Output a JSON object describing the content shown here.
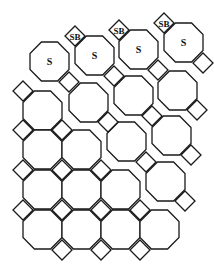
{
  "diagram": {
    "colors": {
      "stroke": "#1a1a1a",
      "fill": "#ffffff",
      "text": "#111111"
    },
    "octagon_size": 39,
    "diamond_half": 10,
    "octagons": [
      {
        "x": 30,
        "y": 42,
        "label": "S",
        "chamfer": []
      },
      {
        "x": 69,
        "y": 83,
        "label": "",
        "chamfer": []
      },
      {
        "x": 107,
        "y": 122,
        "label": "",
        "chamfer": []
      },
      {
        "x": 146,
        "y": 162,
        "label": "",
        "chamfer": []
      },
      {
        "x": 75,
        "y": 36,
        "label": "S",
        "chamfer": []
      },
      {
        "x": 114,
        "y": 76,
        "label": "",
        "chamfer": []
      },
      {
        "x": 152,
        "y": 116,
        "label": "",
        "chamfer": []
      },
      {
        "x": 119,
        "y": 30,
        "label": "S",
        "chamfer": []
      },
      {
        "x": 158,
        "y": 71,
        "label": "",
        "chamfer": []
      },
      {
        "x": 164,
        "y": 23,
        "label": "S",
        "chamfer": []
      },
      {
        "x": 23,
        "y": 91,
        "label": "",
        "chamfer": []
      },
      {
        "x": 23,
        "y": 130,
        "label": "",
        "chamfer": []
      },
      {
        "x": 62,
        "y": 130,
        "label": "",
        "chamfer": []
      },
      {
        "x": 23,
        "y": 170,
        "label": "",
        "chamfer": []
      },
      {
        "x": 62,
        "y": 170,
        "label": "",
        "chamfer": []
      },
      {
        "x": 101,
        "y": 170,
        "label": "",
        "chamfer": []
      },
      {
        "x": 23,
        "y": 210,
        "label": "",
        "chamfer": []
      },
      {
        "x": 62,
        "y": 210,
        "label": "",
        "chamfer": []
      },
      {
        "x": 101,
        "y": 210,
        "label": "",
        "chamfer": []
      },
      {
        "x": 140,
        "y": 210,
        "label": "",
        "chamfer": []
      }
    ],
    "diamonds": [
      {
        "x": 69,
        "y": 82,
        "label": ""
      },
      {
        "x": 108,
        "y": 122,
        "label": ""
      },
      {
        "x": 146,
        "y": 162,
        "label": ""
      },
      {
        "x": 185,
        "y": 201,
        "label": ""
      },
      {
        "x": 75,
        "y": 36,
        "label": "SB"
      },
      {
        "x": 114,
        "y": 76,
        "label": ""
      },
      {
        "x": 152,
        "y": 116,
        "label": ""
      },
      {
        "x": 191,
        "y": 155,
        "label": ""
      },
      {
        "x": 119,
        "y": 30,
        "label": "SB"
      },
      {
        "x": 158,
        "y": 70,
        "label": ""
      },
      {
        "x": 197,
        "y": 110,
        "label": ""
      },
      {
        "x": 164,
        "y": 23,
        "label": "SB"
      },
      {
        "x": 203,
        "y": 63,
        "label": ""
      },
      {
        "x": 23,
        "y": 91,
        "label": ""
      },
      {
        "x": 23,
        "y": 130,
        "label": ""
      },
      {
        "x": 62,
        "y": 130,
        "label": ""
      },
      {
        "x": 23,
        "y": 170,
        "label": ""
      },
      {
        "x": 62,
        "y": 170,
        "label": ""
      },
      {
        "x": 101,
        "y": 170,
        "label": ""
      },
      {
        "x": 23,
        "y": 210,
        "label": ""
      },
      {
        "x": 62,
        "y": 210,
        "label": ""
      },
      {
        "x": 101,
        "y": 210,
        "label": ""
      },
      {
        "x": 140,
        "y": 210,
        "label": ""
      },
      {
        "x": 62,
        "y": 250,
        "label": ""
      },
      {
        "x": 101,
        "y": 250,
        "label": ""
      },
      {
        "x": 140,
        "y": 250,
        "label": ""
      }
    ],
    "labels": {
      "surface": "S",
      "surface_bridge": "SB"
    }
  }
}
